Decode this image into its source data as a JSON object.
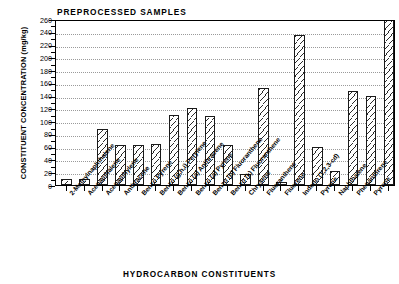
{
  "chart_data": {
    "type": "bar",
    "title": "PREPROCESSED SAMPLES",
    "ylabel": "CONSTITUENT CONCENTRATION (mg/kg)",
    "xlabel": "HYDROCARBON CONSTITUENTS",
    "ylim": [
      0,
      260
    ],
    "ytick_step": 20,
    "yticks": [
      "0",
      "20",
      "40",
      "60",
      "80",
      "100",
      "120",
      "140",
      "160",
      "180",
      "200",
      "220",
      "240",
      "260"
    ],
    "grid": true,
    "legend": "none",
    "categories": [
      "2-Methylnaphthalene",
      "Acenapthalene",
      "Acenapthylene",
      "Anthracene",
      "Benzo Pyrene",
      "Benzo (g,h,i) Perylene",
      "Benzo (a) Anthracene",
      "Benzo (a) Pyrene",
      "Benzo (b) Fluoranthene",
      "Benzo (k) Fluoranthene",
      "Chrysene",
      "Fluoranthene",
      "Fluorene",
      "Indeno (1,2,3-cd)",
      "Pyrene",
      "Naphthalene",
      "Phenanthrene",
      "Pyrene"
    ],
    "values": [
      10,
      10,
      88,
      63,
      63,
      65,
      110,
      120,
      108,
      62,
      18,
      152,
      5,
      235,
      60,
      22,
      148,
      140
    ],
    "units": "mg/kg"
  }
}
